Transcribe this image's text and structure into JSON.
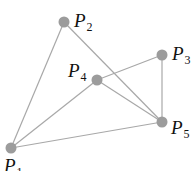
{
  "diagram": {
    "type": "graph",
    "nodes": [
      {
        "id": "P1",
        "letter": "P",
        "sub": "1"
      },
      {
        "id": "P2",
        "letter": "P",
        "sub": "2"
      },
      {
        "id": "P3",
        "letter": "P",
        "sub": "3"
      },
      {
        "id": "P4",
        "letter": "P",
        "sub": "4"
      },
      {
        "id": "P5",
        "letter": "P",
        "sub": "5"
      }
    ],
    "edges": [
      [
        "P1",
        "P2"
      ],
      [
        "P2",
        "P5"
      ],
      [
        "P1",
        "P4"
      ],
      [
        "P4",
        "P3"
      ],
      [
        "P4",
        "P5"
      ],
      [
        "P3",
        "P5"
      ],
      [
        "P1",
        "P5"
      ]
    ],
    "colors": {
      "node": "#9c9c9c",
      "edge": "#a8a8a8",
      "label": "#111111"
    }
  }
}
